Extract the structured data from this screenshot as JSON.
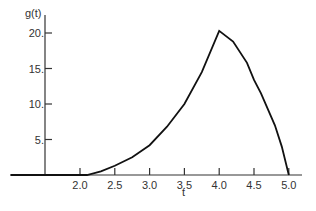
{
  "chart_data": {
    "type": "line",
    "title": "",
    "xlabel": "t",
    "ylabel": "g(t)",
    "xlim": [
      1.5,
      5.2
    ],
    "ylim": [
      0,
      21
    ],
    "grid": false,
    "legend": null,
    "x_ticks": [
      "2.0",
      "2.5",
      "3.0",
      "3.5",
      "4.0",
      "4.5",
      "5.0"
    ],
    "y_ticks": [
      "5.",
      "10.",
      "15.",
      "20."
    ],
    "series": [
      {
        "name": "g(t)",
        "x": [
          1.0,
          2.0,
          2.1,
          2.3,
          2.5,
          2.75,
          3.0,
          3.25,
          3.5,
          3.75,
          4.0,
          4.2,
          4.4,
          4.5,
          4.6,
          4.8,
          4.9,
          5.0
        ],
        "values": [
          0,
          0,
          0,
          0.5,
          1.3,
          2.5,
          4.2,
          6.8,
          10.0,
          14.5,
          20.3,
          18.8,
          15.8,
          13.4,
          11.5,
          7.0,
          4.0,
          0
        ]
      }
    ]
  }
}
